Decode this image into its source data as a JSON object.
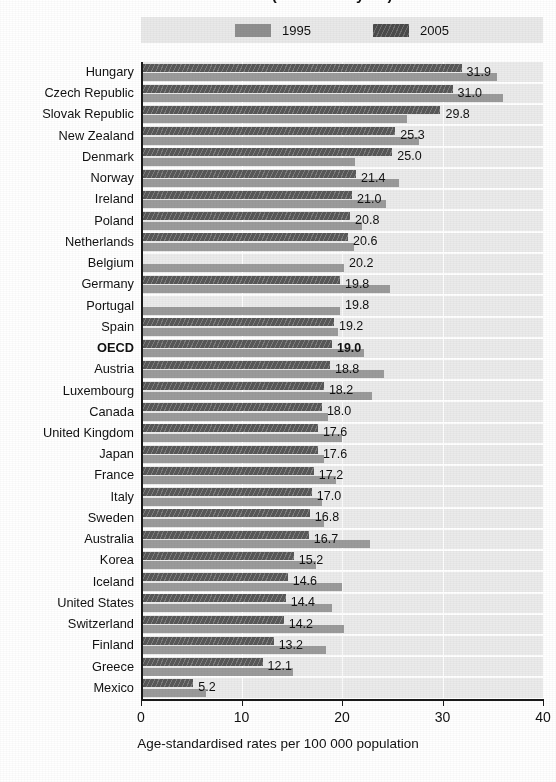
{
  "chart": {
    "title": "1995 and 2005 (or nearest year)",
    "axis_title": "Age-standardised rates per 100 000 population",
    "legend": [
      {
        "label": "1995",
        "color": "#8f8f8f",
        "key": "v1995"
      },
      {
        "label": "2005",
        "color": "#4a4a4a",
        "key": "v2005"
      }
    ]
  },
  "chart_data": {
    "type": "bar",
    "orientation": "horizontal",
    "title": "1995 and 2005 (or nearest year)",
    "xlabel": "Age-standardised rates per 100 000 population",
    "ylabel": "",
    "xlim": [
      0,
      40
    ],
    "xticks": [
      0,
      10,
      20,
      30,
      40
    ],
    "grid": true,
    "legend_position": "top",
    "categories": [
      "Hungary",
      "Czech Republic",
      "Slovak Republic",
      "New Zealand",
      "Denmark",
      "Norway",
      "Ireland",
      "Poland",
      "Netherlands",
      "Belgium",
      "Germany",
      "Portugal",
      "Spain",
      "OECD",
      "Austria",
      "Luxembourg",
      "Canada",
      "United Kingdom",
      "Japan",
      "France",
      "Italy",
      "Sweden",
      "Australia",
      "Korea",
      "Iceland",
      "United States",
      "Switzerland",
      "Finland",
      "Greece",
      "Mexico"
    ],
    "series": [
      {
        "name": "2005",
        "color": "#585858",
        "values": [
          31.9,
          31.0,
          29.8,
          25.3,
          25.0,
          21.4,
          21.0,
          20.8,
          20.6,
          null,
          19.8,
          null,
          19.2,
          19.0,
          18.8,
          18.2,
          18.0,
          17.6,
          17.6,
          17.2,
          17.0,
          16.8,
          16.7,
          15.2,
          14.6,
          14.4,
          14.2,
          13.2,
          12.1,
          5.2
        ]
      },
      {
        "name": "1995",
        "color": "#9b9b9b",
        "values": [
          35.4,
          36.0,
          26.5,
          27.7,
          21.3,
          25.7,
          24.4,
          22.0,
          21.2,
          20.2,
          24.8,
          19.8,
          19.6,
          22.2,
          24.2,
          23.0,
          18.6,
          20.0,
          18.2,
          19.4,
          18.0,
          18.2,
          22.8,
          17.4,
          20.0,
          19.0,
          20.2,
          18.4,
          15.1,
          6.5
        ]
      }
    ],
    "value_labels": [
      {
        "category": "Hungary",
        "text": "31.9",
        "bold": false
      },
      {
        "category": "Czech Republic",
        "text": "31.0",
        "bold": false
      },
      {
        "category": "Slovak Republic",
        "text": "29.8",
        "bold": false
      },
      {
        "category": "New Zealand",
        "text": "25.3",
        "bold": false
      },
      {
        "category": "Denmark",
        "text": "25.0",
        "bold": false
      },
      {
        "category": "Norway",
        "text": "21.4",
        "bold": false
      },
      {
        "category": "Ireland",
        "text": "21.0",
        "bold": false
      },
      {
        "category": "Poland",
        "text": "20.8",
        "bold": false
      },
      {
        "category": "Netherlands",
        "text": "20.6",
        "bold": false
      },
      {
        "category": "Belgium",
        "text": "20.2",
        "bold": false
      },
      {
        "category": "Germany",
        "text": "19.8",
        "bold": false
      },
      {
        "category": "Portugal",
        "text": "19.8",
        "bold": false
      },
      {
        "category": "Spain",
        "text": "19.2",
        "bold": false
      },
      {
        "category": "OECD",
        "text": "19.0",
        "bold": true
      },
      {
        "category": "Austria",
        "text": "18.8",
        "bold": false
      },
      {
        "category": "Luxembourg",
        "text": "18.2",
        "bold": false
      },
      {
        "category": "Canada",
        "text": "18.0",
        "bold": false
      },
      {
        "category": "United Kingdom",
        "text": "17.6",
        "bold": false
      },
      {
        "category": "Japan",
        "text": "17.6",
        "bold": false
      },
      {
        "category": "France",
        "text": "17.2",
        "bold": false
      },
      {
        "category": "Italy",
        "text": "17.0",
        "bold": false
      },
      {
        "category": "Sweden",
        "text": "16.8",
        "bold": false
      },
      {
        "category": "Australia",
        "text": "16.7",
        "bold": false
      },
      {
        "category": "Korea",
        "text": "15.2",
        "bold": false
      },
      {
        "category": "Iceland",
        "text": "14.6",
        "bold": false
      },
      {
        "category": "United States",
        "text": "14.4",
        "bold": false
      },
      {
        "category": "Switzerland",
        "text": "14.2",
        "bold": false
      },
      {
        "category": "Finland",
        "text": "13.2",
        "bold": false
      },
      {
        "category": "Greece",
        "text": "12.1",
        "bold": false
      },
      {
        "category": "Mexico",
        "text": "5.2",
        "bold": false
      }
    ],
    "highlighted_category": "OECD"
  }
}
